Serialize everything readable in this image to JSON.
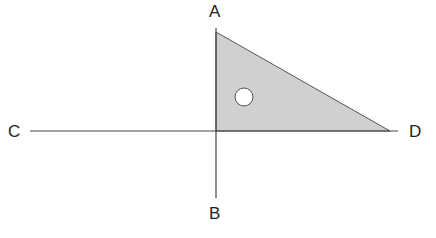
{
  "diagram": {
    "labels": {
      "A": "A",
      "B": "B",
      "C": "C",
      "D": "D"
    },
    "colors": {
      "line": "#444444",
      "triangle_fill": "#d0d0d0",
      "triangle_stroke": "#555555",
      "hole_fill": "#ffffff"
    },
    "lines": [
      {
        "name": "CD",
        "from": [
          30,
          131
        ],
        "to": [
          398,
          131
        ]
      },
      {
        "name": "AB",
        "from": [
          216,
          28
        ],
        "to": [
          216,
          198
        ]
      }
    ],
    "triangle": {
      "points": [
        [
          216,
          32
        ],
        [
          216,
          131
        ],
        [
          390,
          131
        ]
      ]
    },
    "hole": {
      "cx": 244,
      "cy": 97,
      "r": 9
    }
  }
}
